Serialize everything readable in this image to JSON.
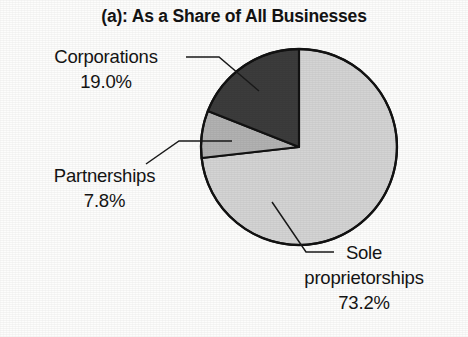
{
  "figure": {
    "title": "(a): As a Share of All Businesses",
    "background_color": "#fdfdfc",
    "outline_color": "#121212"
  },
  "labels": {
    "corporations": {
      "name": "Corporations",
      "value": "19.0%"
    },
    "partnerships": {
      "name": "Partnerships",
      "value": "7.8%"
    },
    "sole": {
      "name_line1": "Sole",
      "name_line2": "proprietorships",
      "value": "73.2%"
    }
  },
  "chart_data": {
    "type": "pie",
    "title": "(a): As a Share of All Businesses",
    "xlabel": "",
    "ylabel": "",
    "units": "percent",
    "total": 100.0,
    "start_angle_deg": 90,
    "direction": "counterclockwise",
    "legend_position": "none (direct labels with leader lines)",
    "grid": false,
    "categories": [
      "Corporations",
      "Partnerships",
      "Sole proprietorships"
    ],
    "values": [
      19.0,
      7.8,
      73.2
    ],
    "labels": [
      "19.0%",
      "7.8%",
      "73.2%"
    ],
    "colors": [
      "#3c3c3c",
      "#b2b2b2",
      "#d4d4d4"
    ],
    "slices": [
      {
        "label": "Corporations",
        "value": 19.0,
        "display": "19.0%",
        "color": "#3c3c3c",
        "sweep_deg": 68.4
      },
      {
        "label": "Partnerships",
        "value": 7.8,
        "display": "7.8%",
        "color": "#b2b2b2",
        "sweep_deg": 28.08
      },
      {
        "label": "Sole proprietorships",
        "value": 73.2,
        "display": "73.2%",
        "color": "#d4d4d4",
        "sweep_deg": 263.52
      }
    ]
  }
}
